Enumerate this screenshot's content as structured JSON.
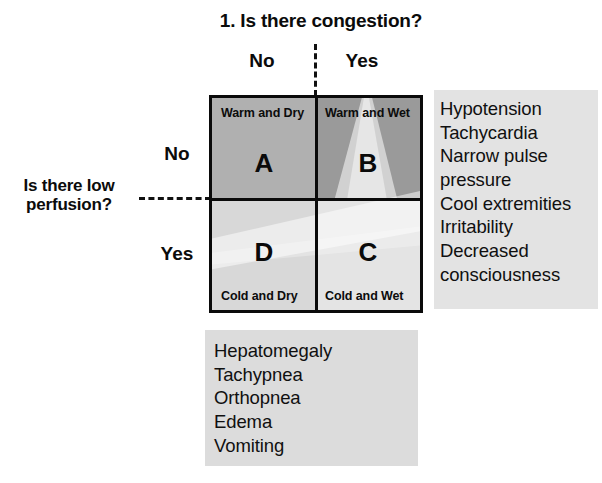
{
  "diagram": {
    "top_question": "1. Is there congestion?",
    "left_question_line1": "Is there low",
    "left_question_line2": "perfusion?",
    "column_headers": {
      "no": "No",
      "yes": "Yes"
    },
    "row_headers": {
      "no": "No",
      "yes": "Yes"
    },
    "quadrants": [
      {
        "id": "A",
        "letter": "A",
        "label": "Warm and Dry",
        "label_position": "top",
        "color": "#b0b0b0",
        "congestion": "No",
        "low_perfusion": "No"
      },
      {
        "id": "B",
        "letter": "B",
        "label": "Warm and Wet",
        "label_position": "top",
        "color": "#9a9a9a",
        "congestion": "Yes",
        "low_perfusion": "No"
      },
      {
        "id": "D",
        "letter": "D",
        "label": "Cold and Dry",
        "label_position": "bottom",
        "color": "#d8d8d8",
        "congestion": "No",
        "low_perfusion": "Yes"
      },
      {
        "id": "C",
        "letter": "C",
        "label": "Cold and Wet",
        "label_position": "bottom",
        "color": "#e4e4e4",
        "congestion": "Yes",
        "low_perfusion": "Yes"
      }
    ],
    "panel_right": {
      "name": "low-perfusion-signs",
      "background": "#e3e3e3",
      "lines": [
        "Hypotension",
        "Tachycardia",
        "Narrow pulse",
        "pressure",
        "Cool extremities",
        "Irritability",
        "Decreased",
        "consciousness"
      ]
    },
    "panel_bottom": {
      "name": "congestion-signs",
      "background": "#dcdcdc",
      "lines": [
        "Hepatomegaly",
        "Tachypnea",
        "Orthopnea",
        "Edema",
        "Vomiting"
      ]
    },
    "colors": {
      "ink": "#0a0a0a",
      "page_background": "#ffffff",
      "dash_line": "#111111"
    }
  }
}
